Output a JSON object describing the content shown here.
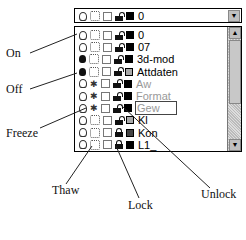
{
  "combo": {
    "selected_layer": "0",
    "dropdown_icon": "chevron-down-icon"
  },
  "layers": [
    {
      "name": "0",
      "on": true,
      "frozen": false,
      "locked": false,
      "color": "#000000",
      "gray": false
    },
    {
      "name": "07",
      "on": true,
      "frozen": false,
      "locked": false,
      "color": "#000000",
      "gray": false
    },
    {
      "name": "3d-mod",
      "on": false,
      "frozen": false,
      "locked": false,
      "color": "#000000",
      "gray": false
    },
    {
      "name": "Attdaten",
      "on": false,
      "frozen": false,
      "locked": false,
      "color": "#aaaaaa",
      "gray": false
    },
    {
      "name": "Aw",
      "on": true,
      "frozen": true,
      "locked": false,
      "color": "#000000",
      "gray": true
    },
    {
      "name": "Format",
      "on": true,
      "frozen": true,
      "locked": false,
      "color": "#000000",
      "gray": true
    },
    {
      "name": "Gew",
      "on": true,
      "frozen": true,
      "locked": false,
      "color": "#000000",
      "gray": true,
      "selected": true
    },
    {
      "name": "Kl",
      "on": true,
      "frozen": false,
      "locked": false,
      "color": "#aaaaaa",
      "gray": false
    },
    {
      "name": "Kon",
      "on": true,
      "frozen": false,
      "locked": true,
      "color": "#444444",
      "gray": false
    },
    {
      "name": "L1_",
      "on": true,
      "frozen": false,
      "locked": true,
      "color": "#000000",
      "gray": false
    }
  ],
  "annotations": {
    "on": "On",
    "off": "Off",
    "freeze": "Freeze",
    "thaw": "Thaw",
    "lock": "Lock",
    "unlock": "Unlock"
  }
}
